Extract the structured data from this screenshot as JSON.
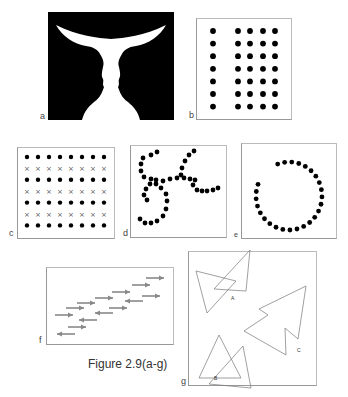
{
  "figure": {
    "caption": "Figure 2.9(a-g)",
    "panels": {
      "a": {
        "label": "a",
        "subject": "Rubin vase / faces illusion"
      },
      "b": {
        "label": "b",
        "subject": "dot grid: 1 column separated from 4 columns, 7 rows"
      },
      "c": {
        "label": "c",
        "subject": "alternating rows of dots and crosses, 8 columns, 7 rows"
      },
      "d": {
        "label": "d",
        "subject": "two crossing dotted curves (continuity)"
      },
      "e": {
        "label": "e",
        "subject": "open circle of dots (closure)"
      },
      "f": {
        "label": "f",
        "subject": "diagonal rows of arrows (common fate)"
      },
      "g": {
        "label": "g",
        "subject": "overlapping triangle pairs",
        "shape_labels": [
          "A",
          "B",
          "C"
        ]
      }
    }
  }
}
